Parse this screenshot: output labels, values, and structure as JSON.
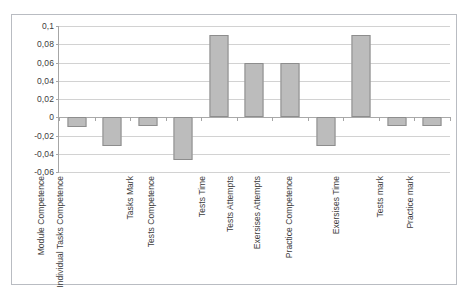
{
  "chart_data": {
    "type": "bar",
    "title": "",
    "subtitle": "",
    "xlabel": "",
    "ylabel": "",
    "ylim": [
      -0.06,
      0.1
    ],
    "grid": true,
    "legend": "none",
    "orientation": "vertical",
    "decimal_separator": ",",
    "y_ticks": [
      0.1,
      0.08,
      0.06,
      0.04,
      0.02,
      0,
      -0.02,
      -0.04,
      -0.06
    ],
    "y_tick_labels": [
      "0,1",
      "0,08",
      "0,06",
      "0,04",
      "0,02",
      "0",
      "-0,02",
      "-0,04",
      "-0,06"
    ],
    "categories": [
      "Module Competence",
      "Individual Tasks Competence",
      "Tasks Mark",
      "Tests Competence",
      "Tests Time",
      "Tests Attempts",
      "Exersises Attempts",
      "Practice Competence",
      "Exersises Time",
      "Tests mark",
      "Practice mark"
    ],
    "values": [
      -0.011,
      -0.031,
      -0.01,
      -0.047,
      0.09,
      0.06,
      0.06,
      -0.031,
      0.09,
      -0.01,
      -0.01
    ],
    "series": [
      {
        "name": "Series 1",
        "values": [
          -0.011,
          -0.031,
          -0.01,
          -0.047,
          0.09,
          0.06,
          0.06,
          -0.031,
          0.09,
          -0.01,
          -0.01
        ]
      }
    ],
    "colors": {
      "bar_fill": "#bcbcbc",
      "bar_border": "#8d8d8d",
      "gridline": "#d2d2d2",
      "axis_line": "#a6a6a6",
      "frame_border": "#b9bcc2",
      "plot_background": "#ffffff",
      "text": "#3c3c3c"
    }
  }
}
